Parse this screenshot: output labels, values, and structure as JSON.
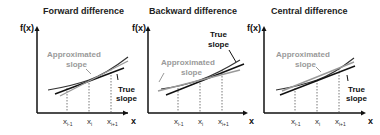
{
  "panels": [
    {
      "title": "Forward difference",
      "y_label": "f(x)",
      "x_label": "x",
      "ticks": [
        "x",
        "x",
        "x"
      ],
      "tick_subs": [
        "i-1",
        "i",
        "i+1"
      ],
      "approx_label_1": "Approximated",
      "approx_label_2": "slope",
      "true_label_1": "True",
      "true_label_2": "slope"
    },
    {
      "title": "Backward difference",
      "y_label": "f(x)",
      "x_label": "x",
      "ticks": [
        "x",
        "x",
        "x"
      ],
      "tick_subs": [
        "i-1",
        "i",
        "i+1"
      ],
      "approx_label_1": "Approximated",
      "approx_label_2": "slope",
      "true_label_1": "True",
      "true_label_2": "slope"
    },
    {
      "title": "Central difference",
      "y_label": "f(x)",
      "x_label": "x",
      "ticks": [
        "x",
        "x",
        "x"
      ],
      "tick_subs": [
        "i-1",
        "i",
        "i+1"
      ],
      "approx_label_1": "Approximated",
      "approx_label_2": "slope",
      "true_label_1": "True",
      "true_label_2": "slope"
    }
  ],
  "colors": {
    "axis": "#111111",
    "curve": "#333333",
    "true_slope": "#111111",
    "approx_slope": "#999999",
    "approx_text": "#9a9a9a",
    "dotted": "#555555"
  }
}
